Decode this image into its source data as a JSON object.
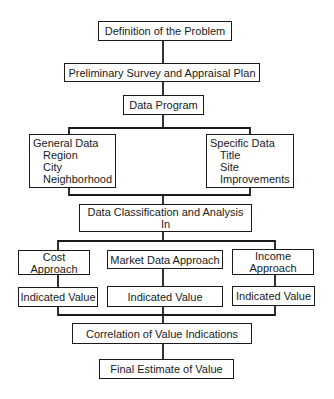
{
  "diagram": {
    "type": "flowchart",
    "nodes": {
      "definition": {
        "label": "Definition of the Problem"
      },
      "survey": {
        "label": "Preliminary Survey and Appraisal Plan"
      },
      "data_program": {
        "label": "Data Program"
      },
      "general_data": {
        "label": "General Data",
        "items": [
          "Region",
          "City",
          "Neighborhood"
        ]
      },
      "specific_data": {
        "label": "Specific Data",
        "items": [
          "Title",
          "Site",
          "Improvements"
        ]
      },
      "classification": {
        "label_line1": "Data Classification and Analysis",
        "label_line2": "In"
      },
      "cost": {
        "label_line1": "Cost",
        "label_line2": "Approach"
      },
      "market": {
        "label": "Market Data Approach"
      },
      "income": {
        "label_line1": "Income",
        "label_line2": "Approach"
      },
      "cost_value": {
        "label": "Indicated Value"
      },
      "market_value": {
        "label": "Indicated Value"
      },
      "income_value": {
        "label": "Indicated Value"
      },
      "correlation": {
        "label": "Correlation of Value Indications"
      },
      "final": {
        "label": "Final Estimate of Value"
      }
    },
    "edges": [
      [
        "definition",
        "survey"
      ],
      [
        "survey",
        "data_program"
      ],
      [
        "data_program",
        "general_data"
      ],
      [
        "data_program",
        "specific_data"
      ],
      [
        "general_data",
        "classification"
      ],
      [
        "specific_data",
        "classification"
      ],
      [
        "classification",
        "cost"
      ],
      [
        "classification",
        "market"
      ],
      [
        "classification",
        "income"
      ],
      [
        "cost",
        "cost_value"
      ],
      [
        "market",
        "market_value"
      ],
      [
        "income",
        "income_value"
      ],
      [
        "cost_value",
        "correlation"
      ],
      [
        "market_value",
        "correlation"
      ],
      [
        "income_value",
        "correlation"
      ],
      [
        "correlation",
        "final"
      ]
    ]
  }
}
